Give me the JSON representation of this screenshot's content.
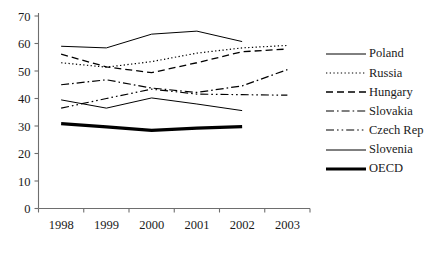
{
  "chart_data": {
    "type": "line",
    "title": "",
    "xlabel": "",
    "ylabel": "",
    "categories": [
      "1998",
      "1999",
      "2000",
      "2001",
      "2002",
      "2003"
    ],
    "x": [
      1998,
      1999,
      2000,
      2001,
      2002,
      2003
    ],
    "ylim": [
      0,
      70
    ],
    "yticks": [
      0,
      10,
      20,
      30,
      40,
      50,
      60,
      70
    ],
    "ytick_labels": [
      "0",
      "10",
      "20",
      "30",
      "40",
      "50",
      "60",
      "70"
    ],
    "grid": false,
    "legend_position": "right",
    "series": [
      {
        "name": "Poland",
        "style": "solid",
        "width": 1.0,
        "values": [
          59.0,
          58.4,
          63.4,
          64.5,
          60.7,
          null
        ]
      },
      {
        "name": "Russia",
        "style": "dotted",
        "width": 1.2,
        "values": [
          53.0,
          51.4,
          53.4,
          56.5,
          58.4,
          59.3
        ]
      },
      {
        "name": "Hungary",
        "style": "dashed",
        "width": 1.3,
        "values": [
          56.1,
          51.5,
          49.4,
          53.0,
          57.0,
          58.0
        ]
      },
      {
        "name": "Slovakia",
        "style": "dash-dot",
        "width": 1.2,
        "values": [
          45.0,
          46.8,
          43.8,
          42.2,
          44.6,
          50.5
        ]
      },
      {
        "name": "Czech Rep",
        "style": "dash-dot-dot",
        "width": 1.2,
        "values": [
          36.5,
          40.0,
          43.4,
          41.6,
          41.4,
          41.2
        ]
      },
      {
        "name": "Slovenia",
        "style": "solid",
        "width": 1.0,
        "values": [
          39.5,
          36.5,
          40.2,
          38.0,
          35.6,
          null
        ]
      },
      {
        "name": "OECD",
        "style": "solid-thick",
        "width": 3.2,
        "values": [
          30.9,
          29.7,
          28.4,
          29.2,
          29.8,
          null
        ]
      }
    ]
  },
  "legend": {
    "items": [
      {
        "label": "Poland"
      },
      {
        "label": "Russia"
      },
      {
        "label": "Hungary"
      },
      {
        "label": "Slovakia"
      },
      {
        "label": "Czech Rep"
      },
      {
        "label": "Slovenia"
      },
      {
        "label": "OECD"
      }
    ]
  }
}
